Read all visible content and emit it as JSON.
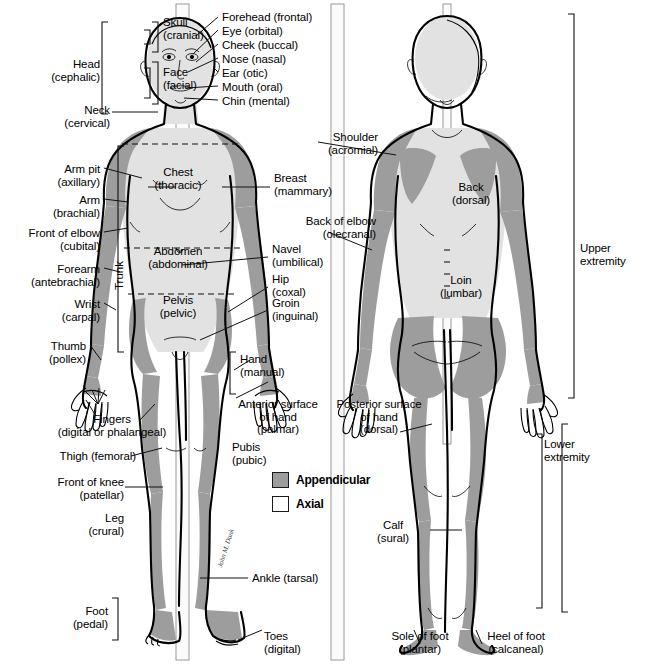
{
  "figure": {
    "legend": {
      "items": [
        {
          "label": "Appendicular",
          "color": "#9d9d9d",
          "swatch": "filled-gray"
        },
        {
          "label": "Axial",
          "color": "#ffffff",
          "swatch": "white"
        }
      ]
    },
    "artist_signature": "John M. Dank"
  },
  "anterior": {
    "brackets": {
      "head": "Head\n(cephalic)",
      "skull": "Skull\n(cranial)",
      "face": "Face\n(facial)",
      "neck": "Neck\n(cervical)",
      "trunk": "Trunk",
      "foot": "Foot\n(pedal)",
      "hand": "Hand\n(manual)"
    },
    "labels_right_of_head": [
      {
        "name": "forehead",
        "text": "Forehead (frontal)"
      },
      {
        "name": "eye",
        "text": "Eye (orbital)"
      },
      {
        "name": "cheek",
        "text": "Cheek (buccal)"
      },
      {
        "name": "nose",
        "text": "Nose (nasal)"
      },
      {
        "name": "ear",
        "text": "Ear (otic)"
      },
      {
        "name": "mouth",
        "text": "Mouth (oral)"
      },
      {
        "name": "chin",
        "text": "Chin (mental)"
      }
    ],
    "labels_left": [
      {
        "name": "arm-pit",
        "text": "Arm pit\n(axillary)"
      },
      {
        "name": "arm",
        "text": "Arm\n(brachial)"
      },
      {
        "name": "front-of-elbow",
        "text": "Front of elbow\n(cubital)"
      },
      {
        "name": "forearm",
        "text": "Forearm\n(antebrachial)"
      },
      {
        "name": "wrist",
        "text": "Wrist\n(carpal)"
      },
      {
        "name": "thumb",
        "text": "Thumb\n(pollex)"
      },
      {
        "name": "fingers",
        "text": "Fingers\n(digital or phalangeal)"
      },
      {
        "name": "thigh",
        "text": "Thigh (femoral)"
      },
      {
        "name": "front-of-knee",
        "text": "Front of knee\n(patellar)"
      },
      {
        "name": "leg",
        "text": "Leg\n(crural)"
      }
    ],
    "labels_center": [
      {
        "name": "chest",
        "text": "Chest\n(thoracic)"
      },
      {
        "name": "abdomen",
        "text": "Abdomen\n(abdominal)"
      },
      {
        "name": "pelvis",
        "text": "Pelvis\n(pelvic)"
      }
    ],
    "labels_right": [
      {
        "name": "breast",
        "text": "Breast\n(mammary)"
      },
      {
        "name": "navel",
        "text": "Navel\n(umbilical)"
      },
      {
        "name": "hip",
        "text": "Hip\n(coxal)"
      },
      {
        "name": "groin",
        "text": "Groin\n(inguinal)"
      }
    ],
    "labels_lower": [
      {
        "name": "anterior-surface-of-hand",
        "text": "Anterior surface\nof hand\n(palmar)"
      },
      {
        "name": "pubis",
        "text": "Pubis\n(pubic)"
      },
      {
        "name": "ankle",
        "text": "Ankle (tarsal)"
      },
      {
        "name": "toes",
        "text": "Toes\n(digital)"
      }
    ]
  },
  "posterior": {
    "labels": [
      {
        "name": "shoulder",
        "text": "Shoulder\n(acromial)"
      },
      {
        "name": "back",
        "text": "Back\n(dorsal)"
      },
      {
        "name": "back-of-elbow",
        "text": "Back of elbow\n(olecranal)"
      },
      {
        "name": "loin",
        "text": "Loin\n(lumbar)"
      },
      {
        "name": "posterior-surface-of-hand",
        "text": "Posterior surface\nof hand\n(dorsal)"
      },
      {
        "name": "calf",
        "text": "Calf\n(sural)"
      },
      {
        "name": "sole-of-foot",
        "text": "Sole of foot\n(plantar)"
      },
      {
        "name": "heel-of-foot",
        "text": "Heel of foot\n(calcaneal)"
      }
    ],
    "brackets": {
      "upper_extremity": "Upper\nextremity",
      "lower_extremity": "Lower\nextremity"
    }
  }
}
